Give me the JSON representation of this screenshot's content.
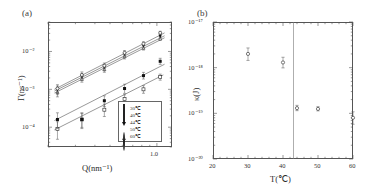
{
  "figure": {
    "panel_a": {
      "label": "(a)",
      "xlabel": "Q(nm⁻¹)",
      "ylabel": "Γ(ns⁻¹)",
      "xticklabels": [
        "1.0"
      ],
      "yticklabels": [
        "10⁻²",
        "10⁻³",
        "10⁻⁴"
      ],
      "legend": [
        {
          "marker": "open-square",
          "label": "30℃"
        },
        {
          "marker": "filled-square",
          "label": "40℃"
        },
        {
          "marker": "open-triangle-up",
          "label": "44℃"
        },
        {
          "marker": "filled-triangle-down",
          "label": "50℃"
        },
        {
          "marker": "open-circle",
          "label": "60℃"
        }
      ]
    },
    "panel_b": {
      "label": "(b)",
      "xlabel": "T(℃)",
      "ylabel": "κ(J)",
      "xticklabels": [
        "20",
        "30",
        "40",
        "50",
        "60"
      ],
      "yticklabels": [
        "10⁻¹⁷",
        "10⁻¹⁸",
        "10⁻¹⁹",
        "10⁻²⁰"
      ]
    }
  },
  "chart_data": [
    {
      "type": "scatter",
      "id": "panel-a",
      "title": "",
      "xlabel": "Q(nm⁻¹)",
      "ylabel": "Γ(ns⁻¹)",
      "xscale": "log",
      "yscale": "log",
      "xlim": [
        0.2,
        1.25
      ],
      "ylim": [
        3e-05,
        0.06
      ],
      "grid": false,
      "legend_position": "lower-right",
      "series": [
        {
          "name": "30℃",
          "marker": "open-square",
          "x": [
            0.23,
            0.33,
            0.46,
            0.62,
            0.82,
            1.05
          ],
          "y": [
            9e-05,
            0.00016,
            0.00029,
            0.00055,
            0.001,
            0.0021
          ],
          "yerr_frac": [
            0.55,
            0.45,
            0.4,
            0.3,
            0.25,
            0.2
          ],
          "fit_line": {
            "x": [
              0.22,
              1.1
            ],
            "y": [
              8.5e-05,
              0.0024
            ]
          }
        },
        {
          "name": "40℃",
          "marker": "filled-square",
          "x": [
            0.23,
            0.33,
            0.46,
            0.62,
            0.82,
            1.05
          ],
          "y": [
            0.00016,
            0.00016,
            0.0005,
            0.00105,
            0.0023,
            0.0055
          ],
          "yerr_frac": [
            0.5,
            0.5,
            0.35,
            0.3,
            0.22,
            0.2
          ],
          "fit_line": {
            "x": [
              0.22,
              1.12
            ],
            "y": [
              0.00015,
              0.0046
            ]
          }
        },
        {
          "name": "44℃",
          "marker": "open-triangle-up",
          "x": [
            0.23,
            0.33,
            0.46,
            0.62,
            0.82,
            1.05
          ],
          "y": [
            0.00085,
            0.0019,
            0.0034,
            0.0075,
            0.0125,
            0.022
          ],
          "yerr_frac": [
            0.3,
            0.22,
            0.2,
            0.18,
            0.15,
            0.12
          ],
          "fit_line": {
            "x": [
              0.22,
              1.12
            ],
            "y": [
              0.0008,
              0.023
            ]
          }
        },
        {
          "name": "50℃",
          "marker": "filled-triangle-down",
          "x": [
            0.23,
            0.33,
            0.46,
            0.62,
            0.82,
            1.05
          ],
          "y": [
            0.00095,
            0.0021,
            0.0037,
            0.0083,
            0.014,
            0.025
          ],
          "yerr_frac": [
            0.28,
            0.22,
            0.18,
            0.16,
            0.14,
            0.12
          ],
          "fit_line": {
            "x": [
              0.22,
              1.12
            ],
            "y": [
              0.0009,
              0.026
            ]
          }
        },
        {
          "name": "60℃",
          "marker": "open-circle",
          "x": [
            0.23,
            0.33,
            0.46,
            0.62,
            0.82,
            1.05
          ],
          "y": [
            0.00105,
            0.0024,
            0.0042,
            0.0092,
            0.016,
            0.031
          ],
          "yerr_frac": [
            0.26,
            0.2,
            0.18,
            0.15,
            0.13,
            0.1
          ],
          "fit_line": {
            "x": [
              0.22,
              1.12
            ],
            "y": [
              0.001,
              0.031
            ]
          }
        }
      ]
    },
    {
      "type": "scatter",
      "id": "panel-b",
      "title": "",
      "xlabel": "T(℃)",
      "ylabel": "κ(J)",
      "xscale": "linear",
      "yscale": "log",
      "xlim": [
        20,
        60
      ],
      "ylim": [
        1e-20,
        1e-17
      ],
      "grid": false,
      "marker": "open-circle",
      "vertical_line_x": 43,
      "x": [
        30,
        40,
        44,
        50,
        60
      ],
      "y": [
        2e-18,
        1.3e-18,
        1.3e-19,
        1.25e-19,
        8e-20
      ],
      "yerr_frac": [
        0.35,
        0.3,
        0.15,
        0.12,
        0.35
      ]
    }
  ]
}
